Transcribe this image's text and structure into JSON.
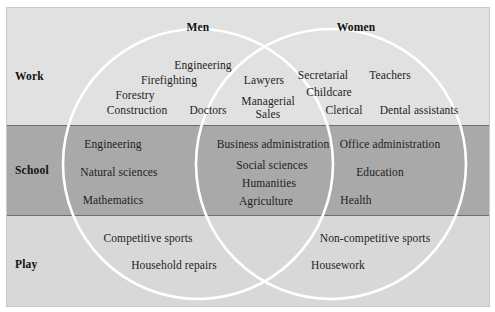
{
  "figure": {
    "type": "venn-diagram",
    "title_row": {
      "men": "Men",
      "women": "Women"
    },
    "row_labels": {
      "work": "Work",
      "school": "School",
      "play": "Play"
    },
    "colors": {
      "canvas": "#ffffff",
      "band_work": "#e1e1e1",
      "band_school": "#a9a9a9",
      "band_play": "#d8d8d8",
      "circle_stroke": "#ffffff",
      "rule": "#6e6e6e",
      "text": "#1d1d1d"
    },
    "rows": [
      {
        "label": "Work",
        "men_only": [
          "Engineering",
          "Firefighting",
          "Forestry",
          "Construction",
          "Doctors"
        ],
        "overlap": [
          "Lawyers",
          "Managerial",
          "Sales"
        ],
        "women_only": [
          "Secretarial",
          "Teachers",
          "Childcare",
          "Clerical",
          "Dental assistants"
        ]
      },
      {
        "label": "School",
        "men_only": [
          "Engineering",
          "Natural sciences",
          "Mathematics"
        ],
        "overlap": [
          "Business administration",
          "Social sciences",
          "Humanities",
          "Agriculture"
        ],
        "women_only": [
          "Office administration",
          "Education",
          "Health"
        ]
      },
      {
        "label": "Play",
        "men_only": [
          "Competitive sports",
          "Household repairs"
        ],
        "overlap": [],
        "women_only": [
          "Non-competitive sports",
          "Housework"
        ]
      }
    ]
  }
}
